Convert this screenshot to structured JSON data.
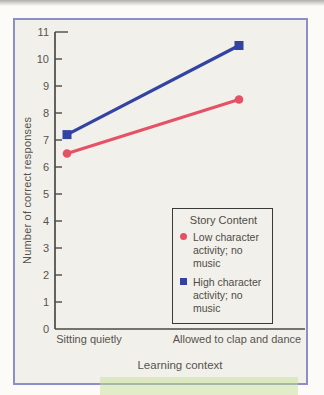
{
  "page": {
    "background": "#fcfbf8",
    "card_background": "#f2f0ea",
    "card_border_color": "#8a8fc9",
    "text_color": "#56544f",
    "axis_color": "#4b4a45",
    "highlight_color": "rgba(197,224,148,0.5)"
  },
  "chart_data": {
    "type": "line",
    "title": "",
    "categories": [
      "Sitting quietly",
      "Allowed to clap and dance"
    ],
    "series": [
      {
        "name": "Low character activity; no music",
        "label": "Low character\nactivity; no music",
        "marker": "circle",
        "color": "#e55266",
        "values": [
          6.5,
          8.5
        ]
      },
      {
        "name": "High character activity; no music",
        "label": "High character\nactivity; no music",
        "marker": "square",
        "color": "#3343a2",
        "values": [
          7.2,
          10.5
        ]
      }
    ],
    "xlabel": "Learning context",
    "ylabel": "Number of correct responses",
    "ylim": [
      0,
      11
    ],
    "y_ticks": [
      0,
      1,
      2,
      3,
      4,
      5,
      6,
      7,
      8,
      9,
      10,
      11
    ],
    "grid": false,
    "legend": {
      "title": "Story Content",
      "position": "lower-right"
    }
  }
}
